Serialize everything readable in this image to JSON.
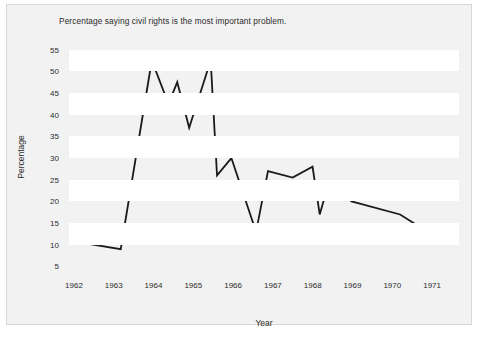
{
  "chart_data": {
    "type": "line",
    "title": "Percentage saying civil rights is the most important problem.",
    "xlabel": "Year",
    "ylabel": "Percentage",
    "xlim": [
      1961.7,
      1971.5
    ],
    "ylim": [
      3.5,
      57
    ],
    "grid": "horizontal-bands",
    "legend": null,
    "xticks": [
      "1962",
      "1963",
      "1964",
      "1965",
      "1966",
      "1967",
      "1968",
      "1969",
      "1970",
      "1971"
    ],
    "yticks": [
      "5",
      "10",
      "15",
      "20",
      "25",
      "30",
      "35",
      "40",
      "45",
      "50",
      "55"
    ],
    "line_color": "#1a1a1a",
    "band_color": "#ffffff",
    "plot_background": "#f2f2f2",
    "series": [
      {
        "name": "Civil rights most important problem",
        "x": [
          1962.0,
          1963.0,
          1963.78,
          1964.2,
          1964.42,
          1964.72,
          1965.26,
          1965.42,
          1965.78,
          1966.4,
          1966.7,
          1967.32,
          1967.82,
          1968.0,
          1968.22,
          1968.8,
          1970.02,
          1971.15
        ],
        "values": [
          10.5,
          9.0,
          52.5,
          42.5,
          47.5,
          37.0,
          52.5,
          26.0,
          30.0,
          13.0,
          27.0,
          25.5,
          28.0,
          17.0,
          24.0,
          20.0,
          17.0,
          10.5
        ]
      }
    ]
  }
}
